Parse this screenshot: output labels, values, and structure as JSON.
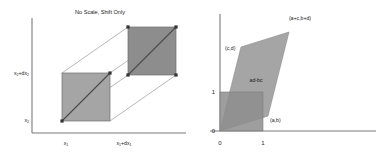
{
  "figure": {
    "width": 380,
    "height": 160,
    "background": "#ffffff"
  },
  "colors": {
    "fill_gray": "#a5a5a5",
    "fill_gray_dark": "#8d8d8d",
    "overlap_gray": "#949494",
    "axis": "#7a7a7a",
    "thin_line": "#9a9a9a",
    "diagonal": "#4a4a4a",
    "text": "#1a1a1a",
    "marker": "#333333"
  },
  "left_panel": {
    "name": "no-scale-shift-only-diagram",
    "title": "No Scale, Shift Only",
    "axes": {
      "x_label_origin": "x",
      "x_label_origin_sub": "1",
      "x_label_shift": "x",
      "x_label_shift_sub": "1",
      "x_label_shift_tail": "+dx",
      "x_label_shift_tail_sub": "1",
      "y_label_origin": "x",
      "y_label_origin_sub": "2",
      "y_label_shift": "x",
      "y_label_shift_sub": "2",
      "y_label_shift_tail": "+dx",
      "y_label_shift_tail_sub": "2"
    },
    "ticks": {
      "x": [
        "x₁",
        "x₁+dx₁"
      ],
      "y": [
        "x₂",
        "x₂+dx₂"
      ]
    },
    "shapes": {
      "square_front": {
        "x": 62,
        "y": 73,
        "w": 48,
        "h": 48
      },
      "square_back": {
        "x": 128,
        "y": 27,
        "w": 48,
        "h": 48
      },
      "description": "two congruent squares, back one translated up-right; joined by connector lines; each square carries a corner-to-corner diagonal with endpoint markers"
    }
  },
  "right_panel": {
    "name": "determinant-area-parallelogram-diagram",
    "title": "",
    "labels": {
      "vertex_ab": "(a,b)",
      "vertex_cd": "(c,d)",
      "vertex_sum": "(a+c,b+d)",
      "area": "ad-bc"
    },
    "ticks": {
      "x": [
        "0",
        "1"
      ],
      "y": [
        "0",
        "1"
      ]
    },
    "unit_square": {
      "x0": 0,
      "y0": 0,
      "x1": 1,
      "y1": 1,
      "description": "reference unit square from (0,0) to (1,1)"
    },
    "parallelogram": {
      "vertices": [
        [
          0,
          0
        ],
        [
          1.45,
          0.47
        ],
        [
          2.08,
          3.02
        ],
        [
          0.63,
          2.55
        ]
      ],
      "vertex_names": [
        "origin",
        "(a,b)",
        "(a+c,b+d)",
        "(c,d)"
      ],
      "area_expression": "ad-bc"
    }
  }
}
